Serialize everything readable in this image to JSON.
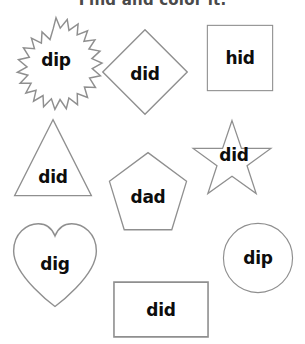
{
  "worksheet": {
    "title": "Find and color it.",
    "title_color": "#4a4a4a",
    "outline_color": "#8f8f8f",
    "word_color": "#0d0d0d",
    "background": "#ffffff",
    "width": 305,
    "height": 344
  },
  "shapes": [
    {
      "id": "starburst",
      "shape_name": "starburst",
      "word": "dip",
      "x": 10,
      "y": 16,
      "w": 92,
      "h": 92,
      "word_offset_x": 0,
      "word_offset_y": -2
    },
    {
      "id": "diamond",
      "shape_name": "diamond",
      "word": "did",
      "x": 101,
      "y": 28,
      "w": 88,
      "h": 88,
      "word_offset_x": 0,
      "word_offset_y": 2
    },
    {
      "id": "square",
      "shape_name": "square",
      "word": "hid",
      "x": 206,
      "y": 24,
      "w": 68,
      "h": 68,
      "word_offset_x": 0,
      "word_offset_y": 0
    },
    {
      "id": "triangle",
      "shape_name": "triangle",
      "word": "did",
      "x": 12,
      "y": 118,
      "w": 82,
      "h": 80,
      "word_offset_x": 0,
      "word_offset_y": 19
    },
    {
      "id": "pentagon",
      "shape_name": "pentagon",
      "word": "dad",
      "x": 104,
      "y": 151,
      "w": 88,
      "h": 82,
      "word_offset_x": 0,
      "word_offset_y": 5
    },
    {
      "id": "star",
      "shape_name": "five-point-star",
      "word": "did",
      "x": 183,
      "y": 119,
      "w": 98,
      "h": 80,
      "word_offset_x": 2,
      "word_offset_y": -4
    },
    {
      "id": "heart",
      "shape_name": "heart",
      "word": "dig",
      "x": 8,
      "y": 222,
      "w": 94,
      "h": 88,
      "word_offset_x": 0,
      "word_offset_y": -2
    },
    {
      "id": "circle",
      "shape_name": "circle",
      "word": "dip",
      "x": 222,
      "y": 222,
      "w": 72,
      "h": 72,
      "word_offset_x": 0,
      "word_offset_y": 0
    },
    {
      "id": "rectangle",
      "shape_name": "rectangle",
      "word": "did",
      "x": 112,
      "y": 281,
      "w": 98,
      "h": 57,
      "word_offset_x": 0,
      "word_offset_y": 0
    }
  ]
}
